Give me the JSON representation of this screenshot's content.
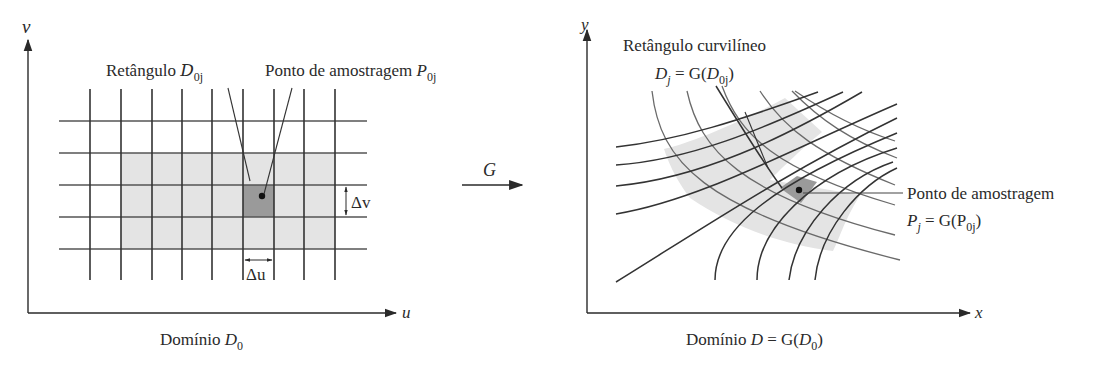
{
  "colors": {
    "ink": "#2a2a2a",
    "grid_line": "#3a3a3a",
    "curve_light": "#6a6a6a",
    "light_fill": "#e4e4e4",
    "dark_fill": "#9a9a9a",
    "dot": "#111111"
  },
  "left_panel": {
    "axis_v_label": "v",
    "axis_u_label": "u",
    "label_rect_prefix": "Retângulo ",
    "label_rect_math": "D",
    "label_rect_sub": "0j",
    "label_point": "Ponto de amostragem ",
    "label_point_math": "P",
    "label_point_sub": "0j",
    "delta_v": "Δv",
    "delta_u": "Δu",
    "domain_caption_text": "Domínio ",
    "domain_caption_math": "D",
    "domain_caption_sub": "0"
  },
  "map_arrow": {
    "label": "G"
  },
  "right_panel": {
    "axis_y_label": "y",
    "axis_x_label": "x",
    "label_curv_title": "Retângulo curvilíneo",
    "label_curv_formula_a": "D",
    "label_curv_formula_a_sub": "j",
    "label_curv_formula_b": " = G(",
    "label_curv_formula_c": "D",
    "label_curv_formula_c_sub": "0j",
    "label_curv_formula_d": ")",
    "label_point_title": "Ponto de amostragem",
    "label_point_formula_a": "P",
    "label_point_formula_a_sub": "j",
    "label_point_formula_b": " = G(P",
    "label_point_formula_c_sub": "0j",
    "label_point_formula_d": ")",
    "domain_caption_text": "Domínio ",
    "domain_caption_math_a": "D",
    "domain_caption_eq": " = G(",
    "domain_caption_math_b": "D",
    "domain_caption_sub": "0",
    "domain_caption_close": ")"
  }
}
